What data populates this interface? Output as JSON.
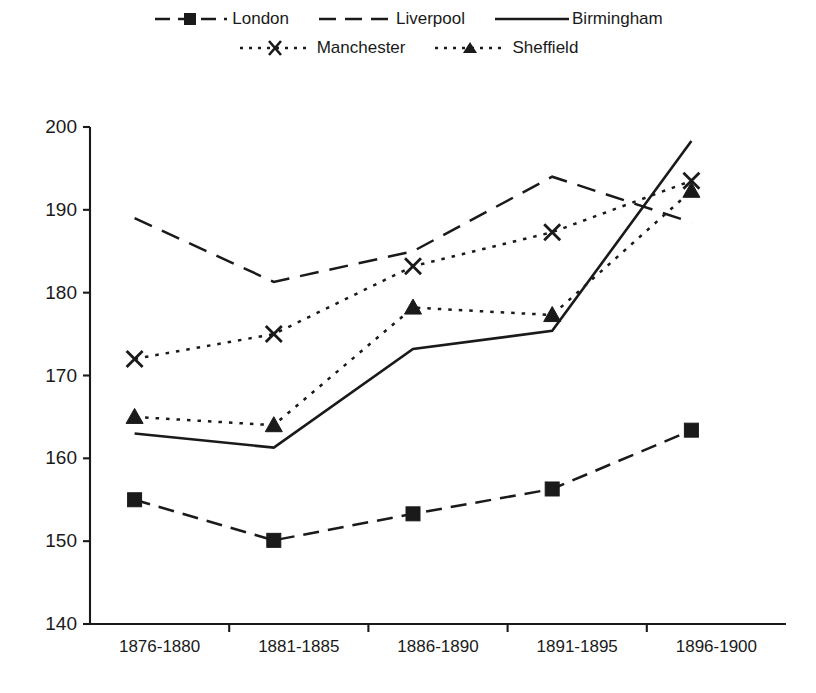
{
  "chart_data": {
    "type": "line",
    "title": "",
    "subtitle": "",
    "xlabel": "",
    "ylabel": "",
    "categories": [
      "1876-1880",
      "1881-1885",
      "1886-1890",
      "1891-1895",
      "1896-1900"
    ],
    "ylim": [
      140,
      200
    ],
    "yticks": [
      140,
      150,
      160,
      170,
      180,
      190,
      200
    ],
    "grid": false,
    "legend_position": "top",
    "series": [
      {
        "name": "London",
        "style": "dashed",
        "marker": "filled-square",
        "values": [
          155.0,
          150.1,
          153.3,
          156.3,
          163.4
        ]
      },
      {
        "name": "Liverpool",
        "style": "long-dashed",
        "marker": "none",
        "values": [
          189.0,
          181.3,
          185.0,
          194.0,
          188.5
        ]
      },
      {
        "name": "Birmingham",
        "style": "solid",
        "marker": "none",
        "values": [
          163.0,
          161.3,
          173.2,
          175.4,
          198.3
        ]
      },
      {
        "name": "Manchester",
        "style": "dotted",
        "marker": "x-cross",
        "values": [
          172.0,
          175.0,
          183.2,
          187.3,
          193.5
        ]
      },
      {
        "name": "Sheffield",
        "style": "dotted",
        "marker": "filled-triangle",
        "values": [
          165.0,
          164.0,
          178.2,
          177.3,
          192.3
        ]
      }
    ]
  },
  "legend": {
    "rows": [
      [
        {
          "label": "London",
          "key": "dashed-square-key"
        },
        {
          "label": "Liverpool",
          "key": "long-dashed-key"
        },
        {
          "label": "Birmingham",
          "key": "solid-key"
        }
      ],
      [
        {
          "label": "Manchester",
          "key": "dotted-x-key"
        },
        {
          "label": "Sheffield",
          "key": "dotted-triangle-key"
        }
      ]
    ]
  },
  "colors": {
    "ink": "#1a1a1a",
    "background": "#ffffff"
  },
  "axis": {
    "y_tick_labels": [
      "200",
      "190",
      "180",
      "170",
      "160",
      "150",
      "140"
    ],
    "x_tick_labels": [
      "1876-1880",
      "1881-1885",
      "1886-1890",
      "1891-1895",
      "1896-1900"
    ]
  }
}
